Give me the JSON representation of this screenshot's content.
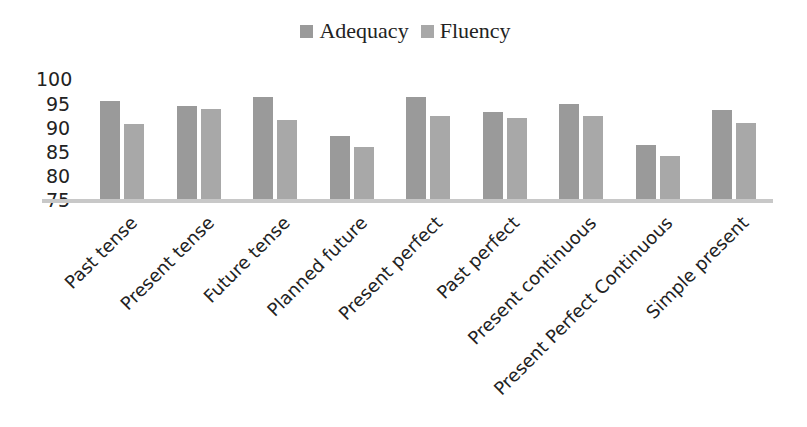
{
  "chart_data": {
    "type": "bar",
    "title": "",
    "xlabel": "",
    "ylabel": "",
    "ylim": [
      75,
      100
    ],
    "yticks": [
      75,
      80,
      85,
      90,
      95,
      100
    ],
    "grid": false,
    "legend_position": "top",
    "categories": [
      "Past tense",
      "Present tense",
      "Future tense",
      "Planned future",
      "Present perfect",
      "Past perfect",
      "Present continuous",
      "Present Perfect Continuous",
      "Simple present"
    ],
    "series": [
      {
        "name": "Adequacy",
        "color": "#9a9a9a",
        "values": [
          95.4,
          94.4,
          96.2,
          88.2,
          96.2,
          93.1,
          94.8,
          86.3,
          93.6
        ]
      },
      {
        "name": "Fluency",
        "color": "#a8a8a8",
        "values": [
          90.7,
          93.8,
          91.5,
          85.9,
          92.3,
          91.9,
          92.3,
          84.1,
          90.9
        ]
      }
    ]
  },
  "legend": {
    "items": [
      "Adequacy",
      "Fluency"
    ]
  },
  "y_axis": {
    "ticks": [
      "100",
      "95",
      "90",
      "85",
      "80",
      "75"
    ]
  }
}
